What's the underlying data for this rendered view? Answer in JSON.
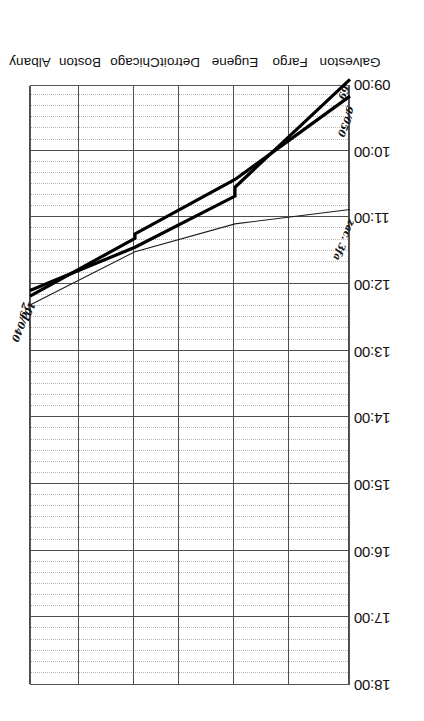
{
  "chart_data": {
    "type": "line",
    "title": "",
    "subtitle": "",
    "xlabel": "",
    "ylabel": "",
    "orientation": "rotated-180",
    "grid": true,
    "legend_position": "none",
    "axis_color": "#4d4d4d",
    "line_color": "#000000",
    "minor_grid_color": "#9a9a9a",
    "categories": [
      "Galveston",
      "Fargo",
      "Eugene",
      "Detroit",
      "Chicago",
      "Boston",
      "Albany"
    ],
    "station_positions": [
      0,
      60,
      115,
      170,
      215,
      270,
      320
    ],
    "ytick_labels": [
      "09:00",
      "10:00",
      "11:00",
      "12:00",
      "13:00",
      "14:00",
      "15:00",
      "16:00",
      "17:00",
      "18:00"
    ],
    "ylim": [
      "09:00",
      "18:00"
    ],
    "minor_tick_minutes": 10,
    "series": [
      {
        "name": "69",
        "label_start": "69",
        "label_end": "101",
        "weight": "thick",
        "direction": "northbound",
        "points": [
          {
            "station": "Galveston",
            "time": "08:55"
          },
          {
            "station": "Eugene",
            "time": "10:32"
          },
          {
            "station": "Eugene",
            "time": "10:40"
          },
          {
            "station": "Chicago",
            "time": "11:26"
          },
          {
            "station": "Albany",
            "time": "12:05"
          }
        ]
      },
      {
        "name": "2",
        "label_start": "2",
        "label_end": "g/050",
        "weight": "thick",
        "direction": "southbound",
        "points": [
          {
            "station": "Albany",
            "time": "12:10"
          },
          {
            "station": "Chicago",
            "time": "11:18"
          },
          {
            "station": "Chicago",
            "time": "11:14"
          },
          {
            "station": "Eugene",
            "time": "10:25"
          },
          {
            "station": "Galveston",
            "time": "09:10"
          }
        ]
      },
      {
        "name": "g/040",
        "label_start": "g/040",
        "label_end": "zac. 3fa",
        "weight": "thin",
        "direction": "southbound",
        "points": [
          {
            "station": "Albany",
            "time": "12:18"
          },
          {
            "station": "Chicago",
            "time": "11:30"
          },
          {
            "station": "Eugene",
            "time": "11:05"
          },
          {
            "station": "Galveston",
            "time": "10:52"
          }
        ]
      }
    ]
  }
}
